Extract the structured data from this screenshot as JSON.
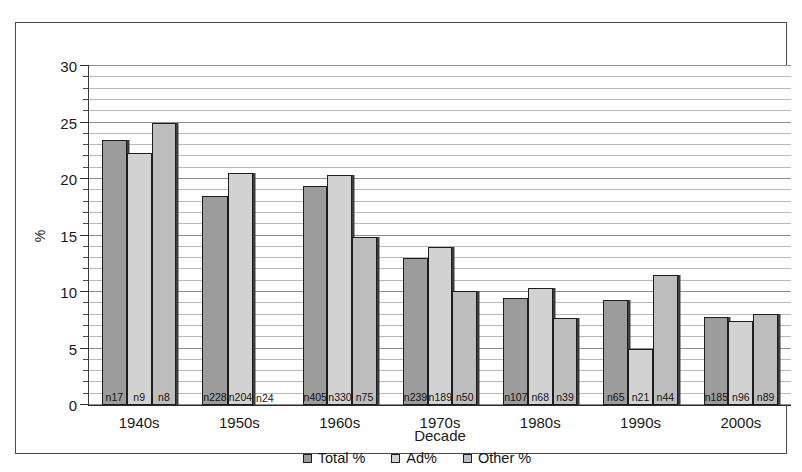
{
  "chart_data": {
    "type": "bar",
    "title": "",
    "xlabel": "Decade",
    "ylabel": "%",
    "ylim": [
      0,
      30
    ],
    "ytick_step": 5,
    "minor_gridline_step": 1,
    "grid": true,
    "legend_position": "bottom",
    "categories": [
      "1940s",
      "1950s",
      "1960s",
      "1970s",
      "1980s",
      "1990s",
      "2000s"
    ],
    "series": [
      {
        "name": "Total %",
        "color": "#9c9c9c",
        "values": [
          23.4,
          18.4,
          19.3,
          13.0,
          9.4,
          9.3,
          7.8
        ],
        "point_labels": [
          "n17",
          "n228",
          "n405",
          "n239",
          "n107",
          "n65",
          "n185"
        ]
      },
      {
        "name": "Ad%",
        "color": "#d2d2d2",
        "values": [
          22.2,
          20.5,
          20.3,
          13.9,
          10.3,
          4.9,
          7.4
        ],
        "point_labels": [
          "n9",
          "n204",
          "n330",
          "n189",
          "n68",
          "n21",
          "n96"
        ]
      },
      {
        "name": "Other %",
        "color": "#bdbdbd",
        "values": [
          24.9,
          0,
          14.8,
          10.1,
          7.7,
          11.5,
          8.0
        ],
        "point_labels": [
          "n8",
          "n24",
          "n75",
          "n50",
          "n39",
          "n44",
          "n89"
        ]
      }
    ],
    "ytick_labels": [
      "0",
      "5",
      "10",
      "15",
      "20",
      "25",
      "30"
    ]
  },
  "axes": {
    "y_title": "%",
    "x_title": "Decade"
  },
  "legend": {
    "items": [
      {
        "label": "Total %"
      },
      {
        "label": "Ad%"
      },
      {
        "label": "Other %"
      }
    ]
  }
}
